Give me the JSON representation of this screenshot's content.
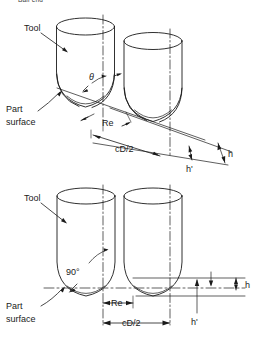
{
  "figure": {
    "cut_caption": "Ball end",
    "background_color": "#ffffff",
    "line_color": "#1a1a1a",
    "views": [
      {
        "id": "isometric-view",
        "name": "ball-end-isometric-view",
        "labels": {
          "tool": "Tool",
          "part_surface_line1": "Part",
          "part_surface_line2": "surface",
          "angle": "θ",
          "effective_radius": "Re",
          "stepover": "cD/2",
          "scallop_height": "h",
          "scallop_height_prime": "h'"
        }
      },
      {
        "id": "front-view",
        "name": "ball-end-front-view",
        "labels": {
          "tool": "Tool",
          "part_surface_line1": "Part",
          "part_surface_line2": "surface",
          "angle": "90°",
          "effective_radius": "Re",
          "stepover": "cD/2",
          "scallop_height": "h",
          "scallop_height_prime": "h'"
        }
      }
    ]
  }
}
